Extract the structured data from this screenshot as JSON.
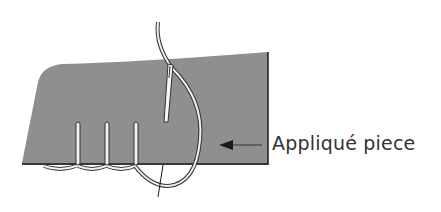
{
  "diagram": {
    "label": "Appliqué piece",
    "colors": {
      "fabric": "#8f8f8f",
      "outline": "#1a1a1a",
      "thread_fill": "#f2f2f2",
      "text": "#333333"
    },
    "elements": [
      "applique-fabric",
      "needle",
      "thread",
      "whip-stitches",
      "arrow"
    ]
  }
}
